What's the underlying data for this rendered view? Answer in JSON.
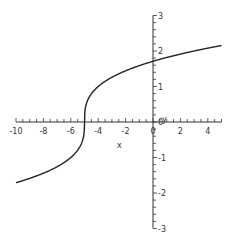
{
  "chart_data": {
    "type": "line",
    "title": "",
    "xlabel": "x",
    "ylabel": "y",
    "xlim": [
      -10,
      5
    ],
    "ylim": [
      -3,
      3
    ],
    "grid": false,
    "legend": null,
    "x_ticks": [
      -10,
      -8,
      -6,
      -4,
      -2,
      0,
      2,
      4
    ],
    "x_tick_labels": [
      "-10",
      "-8",
      "-6",
      "-4",
      "-2",
      "0",
      "2",
      "4"
    ],
    "y_ticks": [
      -3,
      -2,
      -1,
      0,
      1,
      2,
      3
    ],
    "y_tick_labels": [
      "-3",
      "-2",
      "-1",
      "0",
      "1",
      "2",
      "3"
    ],
    "series": [
      {
        "name": "y = (x+5)^(1/3)",
        "x": [
          -10,
          -9,
          -8,
          -7,
          -6,
          -5.5,
          -5.1,
          -5,
          -4.9,
          -4.5,
          -4,
          -3,
          -2,
          -1,
          0,
          1,
          2,
          3,
          4,
          5
        ],
        "y": [
          -1.71,
          -1.59,
          -1.44,
          -1.26,
          -1.0,
          -0.79,
          -0.46,
          0,
          0.46,
          0.79,
          1.0,
          1.26,
          1.44,
          1.59,
          1.71,
          1.82,
          1.91,
          2.0,
          2.08,
          2.15
        ]
      }
    ],
    "colors": {
      "curve": "#222222",
      "axes": "#333333"
    }
  }
}
